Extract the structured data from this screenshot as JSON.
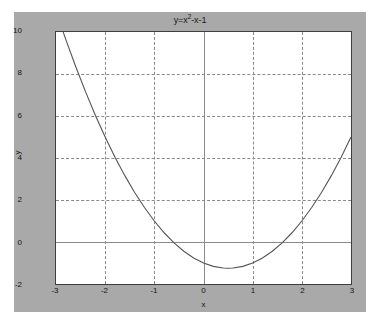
{
  "figure": {
    "background_color": "#a9a9a9",
    "axes_background_color": "#ffffff",
    "axes_border_color": "#3f3f3f",
    "grid_color": "#8a8a8a",
    "curve_color": "#555555"
  },
  "labels": {
    "title_prefix": "y=x",
    "title_exponent": "2",
    "title_suffix": "-x-1",
    "title_full": "y=x2-x-1",
    "xlabel": "x",
    "ylabel": "y"
  },
  "chart_data": {
    "type": "line",
    "xlabel": "x",
    "ylabel": "y",
    "xlim": [
      -3,
      3
    ],
    "ylim": [
      -2,
      10
    ],
    "grid": true,
    "legend": false,
    "xticks": [
      -3,
      -2,
      -1,
      0,
      1,
      2,
      3
    ],
    "xtick_labels": [
      "-3",
      "-2",
      "-1",
      "0",
      "1",
      "2",
      "3"
    ],
    "yticks": [
      -2,
      0,
      2,
      4,
      6,
      8,
      10
    ],
    "ytick_labels": [
      "-2",
      "0",
      "2",
      "4",
      "6",
      "8",
      "10"
    ],
    "series": [
      {
        "name": "y=x^2-x-1",
        "equation": "y = x^2 - x - 1",
        "color": "#555555",
        "linewidth": 1,
        "vertex": [
          0.5,
          -1.25
        ],
        "roots": [
          -0.618,
          1.618
        ],
        "x": [
          -2.9,
          -2.8,
          -2.6,
          -2.4,
          -2.2,
          -2.0,
          -1.8,
          -1.6,
          -1.4,
          -1.2,
          -1.0,
          -0.8,
          -0.6,
          -0.4,
          -0.2,
          0.0,
          0.2,
          0.4,
          0.5,
          0.6,
          0.8,
          1.0,
          1.2,
          1.4,
          1.6,
          1.8,
          2.0,
          2.2,
          2.4,
          2.6,
          2.8,
          3.0
        ],
        "y": [
          10.31,
          9.64,
          8.36,
          7.16,
          6.04,
          5.0,
          4.04,
          3.16,
          2.36,
          1.64,
          1.0,
          0.44,
          -0.04,
          -0.44,
          -0.76,
          -1.0,
          -1.16,
          -1.24,
          -1.25,
          -1.24,
          -1.16,
          -1.0,
          -0.76,
          -0.44,
          -0.04,
          0.44,
          1.0,
          1.64,
          2.36,
          3.16,
          4.04,
          5.0
        ]
      }
    ]
  }
}
